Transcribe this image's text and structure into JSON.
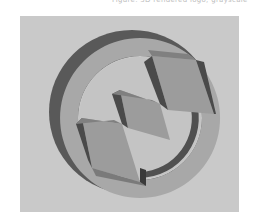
{
  "caption": {
    "text": "Figure: 3D rendered logo, grayscale"
  },
  "figure": {
    "colors": {
      "background": "#c9c9c9",
      "ring_face": "#a6a6a6",
      "ring_side_dark": "#5a5a5a",
      "ring_side_mid": "#7a7a7a",
      "zigzag_face": "#9e9e9e",
      "zigzag_side": "#4a4a4a",
      "inner_light": "#c2c2c2"
    }
  }
}
